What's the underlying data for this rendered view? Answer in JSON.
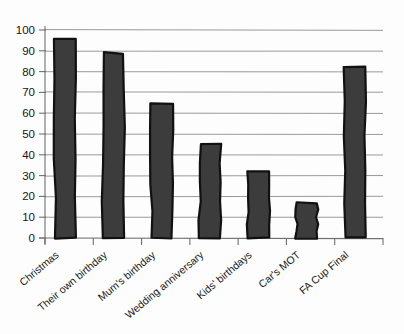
{
  "chart_data": {
    "type": "bar",
    "title": "",
    "subtitle": "",
    "xlabel": "",
    "ylabel": "",
    "categories": [
      "Christmas",
      "Their own birthday",
      "Mum's birthday",
      "Wedding anniversary",
      "Kids' birthdays",
      "Car's MOT",
      "FA Cup Final"
    ],
    "values": [
      96,
      89,
      65,
      45,
      32,
      17,
      82
    ],
    "ylim": [
      0,
      100
    ],
    "ytick_labels": [
      "0",
      "10",
      "20",
      "30",
      "40",
      "50",
      "60",
      "70",
      "80",
      "90",
      "100"
    ],
    "ytick_values": [
      0,
      10,
      20,
      30,
      40,
      50,
      60,
      70,
      80,
      90,
      100
    ],
    "grid": true,
    "grid_axis": "y",
    "legend": false,
    "legend_position": "none",
    "bar_color": "#3c3c3c",
    "bar_edge_color": "#111111",
    "grid_color": "#8e8e8e",
    "background_color": "#fdfdfd",
    "xtick_label_rotation": -40,
    "style": "hand-drawn"
  }
}
